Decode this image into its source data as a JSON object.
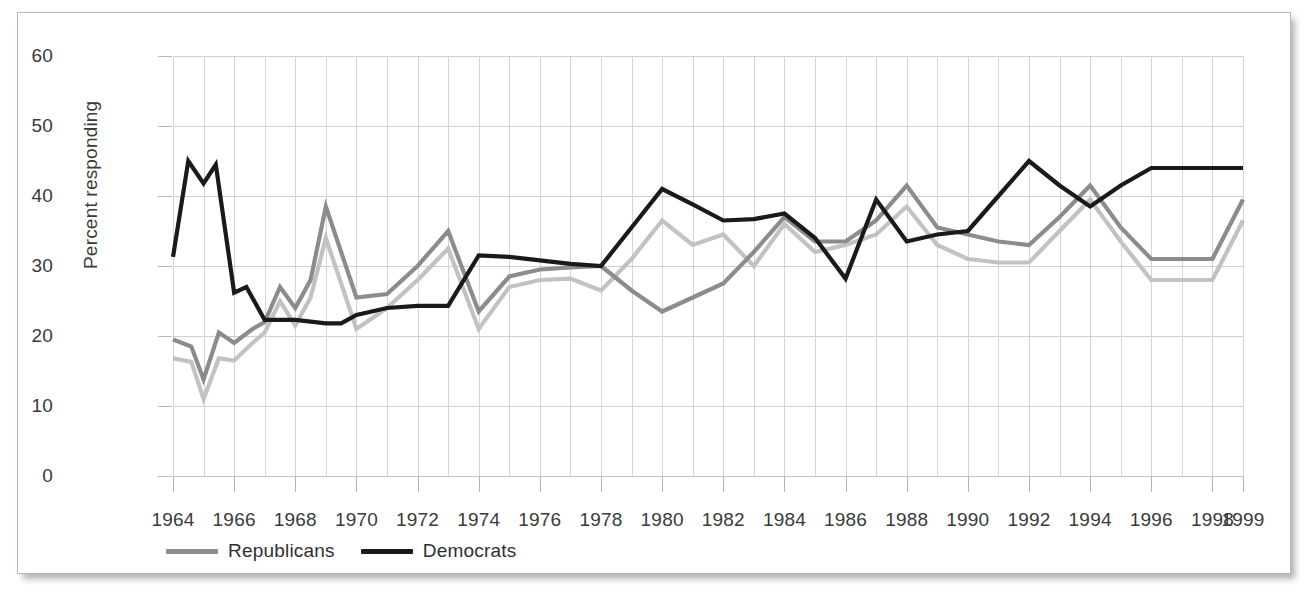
{
  "figure": {
    "background_color": "#ffffff",
    "card_border_color": "#b9b9b9"
  },
  "chart_data": {
    "type": "line",
    "title": "",
    "xlabel": "",
    "ylabel": "Percent responding",
    "xlim": [
      1964,
      1999
    ],
    "ylim": [
      0,
      60
    ],
    "yticks": [
      0,
      10,
      20,
      30,
      40,
      50,
      60
    ],
    "ytick_labels": [
      "0",
      "10",
      "20",
      "30",
      "40",
      "50",
      "60"
    ],
    "xticks": [
      1964,
      1966,
      1968,
      1970,
      1972,
      1974,
      1976,
      1978,
      1980,
      1982,
      1984,
      1986,
      1988,
      1990,
      1992,
      1994,
      1996,
      1998,
      1999
    ],
    "xtick_labels": [
      "1964",
      "1966",
      "1968",
      "1970",
      "1972",
      "1974",
      "1976",
      "1978",
      "1980",
      "1982",
      "1984",
      "1986",
      "1988",
      "1990",
      "1992",
      "1994",
      "1996",
      "1998",
      "1999"
    ],
    "grid": true,
    "grid_color": "#d5d5d5",
    "legend_position": "below-left",
    "x": [
      1964,
      1965,
      1966,
      1967,
      1968,
      1969,
      1970,
      1971,
      1972,
      1973,
      1974,
      1975,
      1976,
      1977,
      1978,
      1979,
      1980,
      1981,
      1982,
      1983,
      1984,
      1985,
      1986,
      1987,
      1988,
      1989,
      1990,
      1991,
      1992,
      1993,
      1994,
      1995,
      1996,
      1997,
      1998,
      1999
    ],
    "series": [
      {
        "name": "Democrats",
        "color": "#1a1a1a",
        "legend_label": "Democrats",
        "in_legend": true,
        "values": [
          31.3,
          45.0,
          41.8,
          44.5,
          26.0,
          25.5,
          22.3,
          22.2,
          21.8,
          22.3,
          23.5,
          24.2,
          24.5,
          26.5,
          31.5,
          31.0,
          30.5,
          30.0,
          41.0,
          38.0,
          36.5,
          36.7,
          37.5,
          34.0,
          28.2,
          39.5,
          33.5,
          36.5,
          35.0,
          33.5,
          45.0,
          39.0,
          41.5,
          44.0,
          44.0,
          44.0
        ]
      },
      {
        "name": "Republicans",
        "color": "#8c8c8c",
        "legend_label": "Republicans",
        "in_legend": true,
        "values": [
          19.5,
          18.8,
          13.8,
          20.5,
          19.0,
          21.0,
          26.5,
          24.0,
          26.0,
          25.5,
          28.0,
          30.5,
          38.5,
          30.0,
          25.5,
          26.5,
          29.0,
          33.0,
          35.0,
          31.5,
          26.5,
          28.5,
          29.5,
          30.0,
          30.0,
          27.5,
          23.5,
          25.5,
          27.5,
          31.5,
          37.5,
          34.5,
          32.5,
          36.5,
          41.5,
          34.5
        ]
      },
      {
        "name": "Independents",
        "color": "#c2c2c2",
        "legend_label": "",
        "in_legend": false,
        "values": [
          16.8,
          16.5,
          11.0,
          16.8,
          17.5,
          20.5,
          24.0,
          22.5,
          24.5,
          24.5,
          26.0,
          28.5,
          36.5,
          28.0,
          23.5,
          24.0,
          27.0,
          31.5,
          33.0,
          29.5,
          24.5,
          26.5,
          28.0,
          29.0,
          28.5,
          26.0,
          21.0,
          22.5,
          25.0,
          30.0,
          35.5,
          32.5,
          31.0,
          34.5,
          39.5,
          33.0
        ]
      }
    ],
    "series_points": {
      "Democrats": [
        [
          1964,
          31.3
        ],
        [
          1964.5,
          45.0
        ],
        [
          1965,
          41.8
        ],
        [
          1965.4,
          44.5
        ],
        [
          1966,
          26.2
        ],
        [
          1966.4,
          27.0
        ],
        [
          1967,
          22.3
        ],
        [
          1968,
          22.3
        ],
        [
          1969,
          21.8
        ],
        [
          1969.5,
          21.8
        ],
        [
          1970,
          23.0
        ],
        [
          1971,
          24.0
        ],
        [
          1972,
          24.3
        ],
        [
          1973,
          24.3
        ],
        [
          1974,
          31.5
        ],
        [
          1975,
          31.3
        ],
        [
          1976,
          30.8
        ],
        [
          1977,
          30.3
        ],
        [
          1978,
          30.0
        ],
        [
          1979,
          35.5
        ],
        [
          1980,
          41.0
        ],
        [
          1981,
          38.8
        ],
        [
          1982,
          36.5
        ],
        [
          1983,
          36.7
        ],
        [
          1984,
          37.5
        ],
        [
          1985,
          34.0
        ],
        [
          1986,
          28.2
        ],
        [
          1987,
          39.5
        ],
        [
          1988,
          33.5
        ],
        [
          1989,
          34.5
        ],
        [
          1990,
          35.0
        ],
        [
          1991,
          40.0
        ],
        [
          1992,
          45.0
        ],
        [
          1993,
          41.5
        ],
        [
          1994,
          38.5
        ],
        [
          1995,
          41.5
        ],
        [
          1996,
          44.0
        ],
        [
          1997,
          44.0
        ],
        [
          1998,
          44.0
        ],
        [
          1999,
          44.0
        ]
      ],
      "Republicans": [
        [
          1964,
          19.5
        ],
        [
          1964.6,
          18.5
        ],
        [
          1965,
          13.8
        ],
        [
          1965.5,
          20.5
        ],
        [
          1966,
          19.0
        ],
        [
          1966.6,
          21.0
        ],
        [
          1967,
          22.0
        ],
        [
          1967.5,
          27.0
        ],
        [
          1968,
          24.0
        ],
        [
          1968.5,
          28.0
        ],
        [
          1969,
          38.5
        ],
        [
          1970,
          25.5
        ],
        [
          1971,
          26.0
        ],
        [
          1972,
          30.0
        ],
        [
          1973,
          35.0
        ],
        [
          1974,
          23.5
        ],
        [
          1975,
          28.5
        ],
        [
          1976,
          29.5
        ],
        [
          1977,
          29.8
        ],
        [
          1978,
          30.0
        ],
        [
          1979,
          26.5
        ],
        [
          1980,
          23.5
        ],
        [
          1981,
          25.5
        ],
        [
          1982,
          27.5
        ],
        [
          1983,
          32.0
        ],
        [
          1984,
          37.0
        ],
        [
          1985,
          33.5
        ],
        [
          1986,
          33.5
        ],
        [
          1987,
          36.5
        ],
        [
          1988,
          41.5
        ],
        [
          1989,
          35.5
        ],
        [
          1990,
          34.5
        ],
        [
          1991,
          33.5
        ],
        [
          1992,
          33.0
        ],
        [
          1993,
          37.0
        ],
        [
          1994,
          41.5
        ],
        [
          1995,
          35.5
        ],
        [
          1996,
          31.0
        ],
        [
          1997,
          31.0
        ],
        [
          1998,
          31.0
        ],
        [
          1999,
          39.5
        ]
      ],
      "Independents": [
        [
          1964,
          16.8
        ],
        [
          1964.6,
          16.3
        ],
        [
          1965,
          11.0
        ],
        [
          1965.5,
          16.8
        ],
        [
          1966,
          16.5
        ],
        [
          1966.6,
          19.0
        ],
        [
          1967,
          20.5
        ],
        [
          1967.5,
          25.0
        ],
        [
          1968,
          21.5
        ],
        [
          1968.5,
          25.5
        ],
        [
          1969,
          34.0
        ],
        [
          1970,
          21.0
        ],
        [
          1971,
          24.0
        ],
        [
          1972,
          28.0
        ],
        [
          1973,
          32.5
        ],
        [
          1974,
          21.0
        ],
        [
          1975,
          27.0
        ],
        [
          1976,
          28.0
        ],
        [
          1977,
          28.2
        ],
        [
          1978,
          26.5
        ],
        [
          1979,
          31.0
        ],
        [
          1980,
          36.5
        ],
        [
          1981,
          33.0
        ],
        [
          1982,
          34.5
        ],
        [
          1983,
          30.0
        ],
        [
          1984,
          36.0
        ],
        [
          1985,
          32.0
        ],
        [
          1986,
          33.0
        ],
        [
          1987,
          34.5
        ],
        [
          1988,
          38.5
        ],
        [
          1989,
          33.0
        ],
        [
          1990,
          31.0
        ],
        [
          1991,
          30.5
        ],
        [
          1992,
          30.5
        ],
        [
          1993,
          35.0
        ],
        [
          1994,
          39.5
        ],
        [
          1995,
          33.5
        ],
        [
          1996,
          28.0
        ],
        [
          1997,
          28.0
        ],
        [
          1998,
          28.0
        ],
        [
          1999,
          36.5
        ]
      ]
    }
  },
  "legend": {
    "items": [
      {
        "label": "Republicans",
        "color": "#8c8c8c"
      },
      {
        "label": "Democrats",
        "color": "#1a1a1a"
      }
    ]
  }
}
